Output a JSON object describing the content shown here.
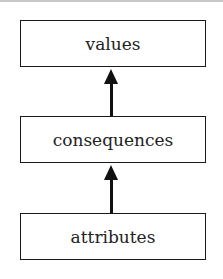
{
  "diagram": {
    "nodes": [
      {
        "id": "values",
        "label": "values"
      },
      {
        "id": "consequences",
        "label": "consequences"
      },
      {
        "id": "attributes",
        "label": "attributes"
      }
    ],
    "edges": [
      {
        "from": "consequences",
        "to": "values"
      },
      {
        "from": "attributes",
        "to": "consequences"
      }
    ]
  }
}
